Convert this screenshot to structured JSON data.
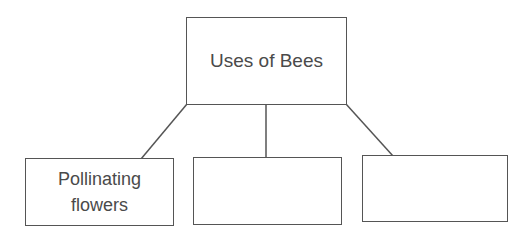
{
  "diagram": {
    "type": "tree",
    "root": {
      "label": "Uses of Bees"
    },
    "children": [
      {
        "label": "Pollinating flowers"
      },
      {
        "label": ""
      },
      {
        "label": ""
      }
    ],
    "colors": {
      "line": "#555555",
      "text": "#4a4a4a",
      "background": "#ffffff"
    }
  }
}
